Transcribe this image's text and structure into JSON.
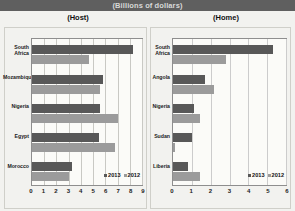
{
  "header": {
    "title": "(Billions of dollars)"
  },
  "panels": {
    "left_title": "(Host)",
    "right_title": "(Home)"
  },
  "legend": {
    "series_dark": "2013",
    "series_light": "2012",
    "color_dark": "#585858",
    "color_light": "#9b9b9b"
  },
  "chart_data": [
    {
      "type": "bar",
      "title": "(Host)",
      "orientation": "horizontal",
      "categories": [
        "South Africa",
        "Mozambique",
        "Nigeria",
        "Egypt",
        "Morocco"
      ],
      "series": [
        {
          "name": "2013",
          "values": [
            8.3,
            5.8,
            5.6,
            5.5,
            3.3
          ]
        },
        {
          "name": "2012",
          "values": [
            4.7,
            5.6,
            7.0,
            6.8,
            3.0
          ]
        }
      ],
      "xlabel": "",
      "ylabel": "",
      "xlim": [
        0,
        9
      ],
      "xticks": [
        0,
        1,
        2,
        3,
        4,
        5,
        6,
        7,
        8,
        9
      ],
      "grid": true,
      "legend_position": "bottom-right",
      "units": "Billions of dollars"
    },
    {
      "type": "bar",
      "title": "(Home)",
      "orientation": "horizontal",
      "categories": [
        "South Africa",
        "Angola",
        "Nigeria",
        "Sudan",
        "Liberia"
      ],
      "series": [
        {
          "name": "2013",
          "values": [
            5.3,
            1.7,
            1.1,
            1.0,
            0.8
          ]
        },
        {
          "name": "2012",
          "values": [
            2.8,
            2.2,
            1.45,
            0.1,
            1.45
          ]
        }
      ],
      "xlabel": "",
      "ylabel": "",
      "xlim": [
        0,
        6
      ],
      "xticks": [
        0,
        1,
        2,
        3,
        4,
        5,
        6
      ],
      "grid": true,
      "legend_position": "bottom-right",
      "units": "Billions of dollars"
    }
  ]
}
